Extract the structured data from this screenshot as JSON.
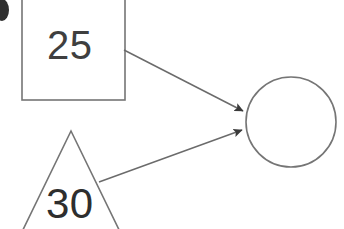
{
  "canvas": {
    "width": 344,
    "height": 229,
    "background": "#ffffff"
  },
  "diagram": {
    "type": "node-link-diagram",
    "stroke_color": "#6b6b6b",
    "text_color": "#3a3a3a",
    "nodes": [
      {
        "id": "square-node",
        "shape": "square",
        "label": "25",
        "x": 22,
        "y": -6,
        "width": 103,
        "height": 106,
        "fill": "none",
        "stroke": "#6b6b6b",
        "cropped": "top"
      },
      {
        "id": "triangle-node",
        "shape": "triangle",
        "label": "30",
        "apex_x": 71,
        "apex_y": 131,
        "half_width": 52,
        "base_y": 240,
        "fill": "none",
        "stroke": "#6b6b6b",
        "cropped": "bottom"
      },
      {
        "id": "circle-node",
        "shape": "circle",
        "label": "",
        "cx": 291,
        "cy": 122,
        "r": 45,
        "fill": "none",
        "stroke": "#6b6b6b"
      }
    ],
    "edges": [
      {
        "id": "edge-square-to-circle",
        "from": "square-node",
        "to": "circle-node",
        "x1": 124,
        "y1": 50,
        "x2": 247,
        "y2": 113,
        "arrowhead": "filled-triangle",
        "stroke": "#6b6b6b"
      },
      {
        "id": "edge-triangle-to-circle",
        "from": "triangle-node",
        "to": "circle-node",
        "x1": 99,
        "y1": 182,
        "x2": 246,
        "y2": 129,
        "arrowhead": "filled-triangle",
        "stroke": "#6b6b6b"
      }
    ],
    "marks": [
      {
        "id": "corner-dot",
        "shape": "ellipse",
        "cx": 2,
        "cy": 10,
        "rx": 7,
        "ry": 11,
        "fill": "#2f2f2f",
        "cropped": "left"
      }
    ]
  }
}
